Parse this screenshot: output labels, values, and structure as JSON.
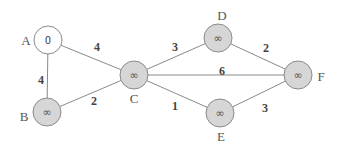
{
  "diagram": {
    "type": "weighted-undirected-graph",
    "colors": {
      "start_node_fill": "#ffffff",
      "node_fill": "#d6d6d6",
      "stroke": "#8a8a8a",
      "text": "#444444"
    },
    "nodes": [
      {
        "id": "A",
        "label": "A",
        "value": "0",
        "cx": 48,
        "cy": 40,
        "fill": "#ffffff",
        "label_x": 26,
        "label_y": 45,
        "anchor": "middle"
      },
      {
        "id": "B",
        "label": "B",
        "value": "∞",
        "cx": 47,
        "cy": 112,
        "fill": "#d6d6d6",
        "label_x": 24,
        "label_y": 121,
        "anchor": "middle"
      },
      {
        "id": "C",
        "label": "C",
        "value": "∞",
        "cx": 134,
        "cy": 75,
        "fill": "#d6d6d6",
        "label_x": 134,
        "label_y": 103,
        "anchor": "middle"
      },
      {
        "id": "D",
        "label": "D",
        "value": "∞",
        "cx": 218,
        "cy": 38,
        "fill": "#d6d6d6",
        "label_x": 222,
        "label_y": 20,
        "anchor": "middle"
      },
      {
        "id": "E",
        "label": "E",
        "value": "∞",
        "cx": 220,
        "cy": 113,
        "fill": "#d6d6d6",
        "label_x": 221,
        "label_y": 141,
        "anchor": "middle"
      },
      {
        "id": "F",
        "label": "F",
        "value": "∞",
        "cx": 298,
        "cy": 75,
        "fill": "#d6d6d6",
        "label_x": 321,
        "label_y": 81,
        "anchor": "middle"
      }
    ],
    "edges": [
      {
        "from": "A",
        "to": "C",
        "weight": "4",
        "wx": 97,
        "wy": 51
      },
      {
        "from": "A",
        "to": "B",
        "weight": "4",
        "wx": 41,
        "wy": 84
      },
      {
        "from": "B",
        "to": "C",
        "weight": "2",
        "wx": 94,
        "wy": 105
      },
      {
        "from": "C",
        "to": "D",
        "weight": "3",
        "wx": 175,
        "wy": 51
      },
      {
        "from": "C",
        "to": "F",
        "weight": "6",
        "wx": 222,
        "wy": 75
      },
      {
        "from": "C",
        "to": "E",
        "weight": "1",
        "wx": 175,
        "wy": 110
      },
      {
        "from": "D",
        "to": "F",
        "weight": "2",
        "wx": 266,
        "wy": 52
      },
      {
        "from": "E",
        "to": "F",
        "weight": "3",
        "wx": 265,
        "wy": 112
      }
    ],
    "node_radius": 14
  }
}
